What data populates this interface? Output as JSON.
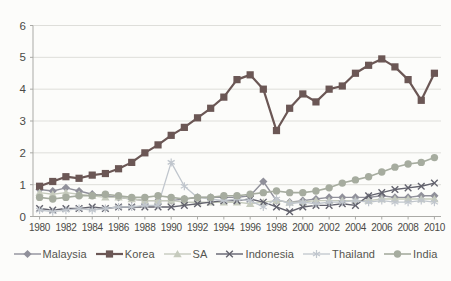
{
  "chart_data": {
    "type": "line",
    "title": "",
    "xlabel": "",
    "ylabel": "",
    "x": [
      1980,
      1981,
      1982,
      1983,
      1984,
      1985,
      1986,
      1987,
      1988,
      1989,
      1990,
      1991,
      1992,
      1993,
      1994,
      1995,
      1996,
      1997,
      1998,
      1999,
      2000,
      2001,
      2002,
      2003,
      2004,
      2005,
      2006,
      2007,
      2008,
      2009,
      2010
    ],
    "x_tick_labels": [
      "1980",
      "1982",
      "1984",
      "1986",
      "1988",
      "1990",
      "1992",
      "1994",
      "1996",
      "1998",
      "2000",
      "2002",
      "2004",
      "2006",
      "2008",
      "2010"
    ],
    "ylim": [
      0,
      6
    ],
    "y_ticks": [
      0,
      1,
      2,
      3,
      4,
      5,
      6
    ],
    "grid": "horizontal",
    "legend_position": "bottom",
    "series": [
      {
        "name": "Malaysia",
        "marker": "diamond",
        "color": "#90909a",
        "line_width": 1.4,
        "values": [
          0.85,
          0.8,
          0.9,
          0.8,
          0.7,
          0.65,
          0.6,
          0.55,
          0.5,
          0.5,
          0.5,
          0.55,
          0.6,
          0.6,
          0.6,
          0.6,
          0.65,
          1.1,
          0.5,
          0.45,
          0.5,
          0.55,
          0.6,
          0.6,
          0.6,
          0.6,
          0.65,
          0.6,
          0.6,
          0.65,
          0.65
        ]
      },
      {
        "name": "Korea",
        "marker": "square",
        "color": "#6b5755",
        "line_width": 2.2,
        "values": [
          0.95,
          1.1,
          1.25,
          1.2,
          1.3,
          1.35,
          1.5,
          1.7,
          2.0,
          2.25,
          2.55,
          2.8,
          3.1,
          3.4,
          3.75,
          4.3,
          4.45,
          4.0,
          2.7,
          3.4,
          3.85,
          3.6,
          4.0,
          4.1,
          4.5,
          4.75,
          4.95,
          4.7,
          4.3,
          3.65,
          4.5
        ]
      },
      {
        "name": "SA",
        "marker": "triangle",
        "color": "#c6cbbd",
        "line_width": 1.4,
        "values": [
          0.75,
          0.7,
          0.75,
          0.7,
          0.65,
          0.6,
          0.6,
          0.55,
          0.5,
          0.5,
          0.5,
          0.45,
          0.45,
          0.45,
          0.45,
          0.45,
          0.4,
          0.45,
          0.5,
          0.45,
          0.45,
          0.5,
          0.5,
          0.5,
          0.5,
          0.5,
          0.55,
          0.55,
          0.55,
          0.55,
          0.55
        ]
      },
      {
        "name": "Indonesia",
        "marker": "x",
        "color": "#62626d",
        "line_width": 1.4,
        "values": [
          0.25,
          0.2,
          0.25,
          0.25,
          0.3,
          0.25,
          0.3,
          0.3,
          0.3,
          0.3,
          0.3,
          0.35,
          0.4,
          0.45,
          0.5,
          0.5,
          0.55,
          0.45,
          0.3,
          0.15,
          0.3,
          0.35,
          0.35,
          0.4,
          0.35,
          0.65,
          0.75,
          0.85,
          0.9,
          0.95,
          1.05
        ]
      },
      {
        "name": "Thailand",
        "marker": "asterisk",
        "color": "#c0c6cd",
        "line_width": 1.3,
        "values": [
          0.2,
          0.15,
          0.2,
          0.25,
          0.2,
          0.25,
          0.3,
          0.3,
          0.35,
          0.35,
          1.7,
          0.95,
          0.6,
          0.55,
          0.5,
          0.55,
          0.5,
          0.3,
          0.55,
          0.4,
          0.45,
          0.4,
          0.45,
          0.45,
          0.5,
          0.45,
          0.5,
          0.45,
          0.45,
          0.5,
          0.45
        ]
      },
      {
        "name": "India",
        "marker": "circle",
        "color": "#a6ac9f",
        "line_width": 1.6,
        "values": [
          0.6,
          0.55,
          0.6,
          0.65,
          0.65,
          0.7,
          0.65,
          0.6,
          0.6,
          0.65,
          0.6,
          0.55,
          0.6,
          0.6,
          0.65,
          0.65,
          0.7,
          0.75,
          0.8,
          0.75,
          0.75,
          0.8,
          0.9,
          1.05,
          1.15,
          1.25,
          1.4,
          1.55,
          1.65,
          1.7,
          1.85
        ]
      }
    ]
  },
  "style": {
    "background": "#fcfcfa",
    "grid_color": "#dededa",
    "axis_color": "#aaaaa6",
    "tick_text_color": "#4a4a46",
    "legend_text_color": "#55554f"
  }
}
